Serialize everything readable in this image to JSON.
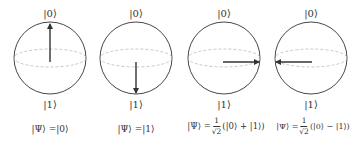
{
  "diagram": {
    "type": "bloch-spheres",
    "colors": {
      "outline": "#333333",
      "equator": "#bbbbbb",
      "arrow": "#333333"
    },
    "spheres": [
      {
        "top_label": "|0⟩",
        "bottom_label": "|1⟩",
        "arrow": "up",
        "formula": {
          "lhs": "|Ψ⟩ = ",
          "frac_num": "",
          "frac_den": "",
          "rhs": "|0⟩"
        }
      },
      {
        "top_label": "|0⟩",
        "bottom_label": "|1⟩",
        "arrow": "down",
        "formula": {
          "lhs": "|Ψ⟩ = ",
          "frac_num": "",
          "frac_den": "",
          "rhs": "|1⟩"
        }
      },
      {
        "top_label": "|0⟩",
        "bottom_label": "|1⟩",
        "arrow": "right",
        "formula": {
          "lhs": "|Ψ⟩ = ",
          "frac_num": "1",
          "frac_den": "√2",
          "rhs": "(|0⟩ + |1⟩)"
        }
      },
      {
        "top_label": "|0⟩",
        "bottom_label": "|1⟩",
        "arrow": "left",
        "formula": {
          "lhs": "|Ψ⟩ = ",
          "frac_num": "1",
          "frac_den": "√2",
          "rhs": "(|0⟩ − |1⟩)"
        }
      }
    ]
  }
}
